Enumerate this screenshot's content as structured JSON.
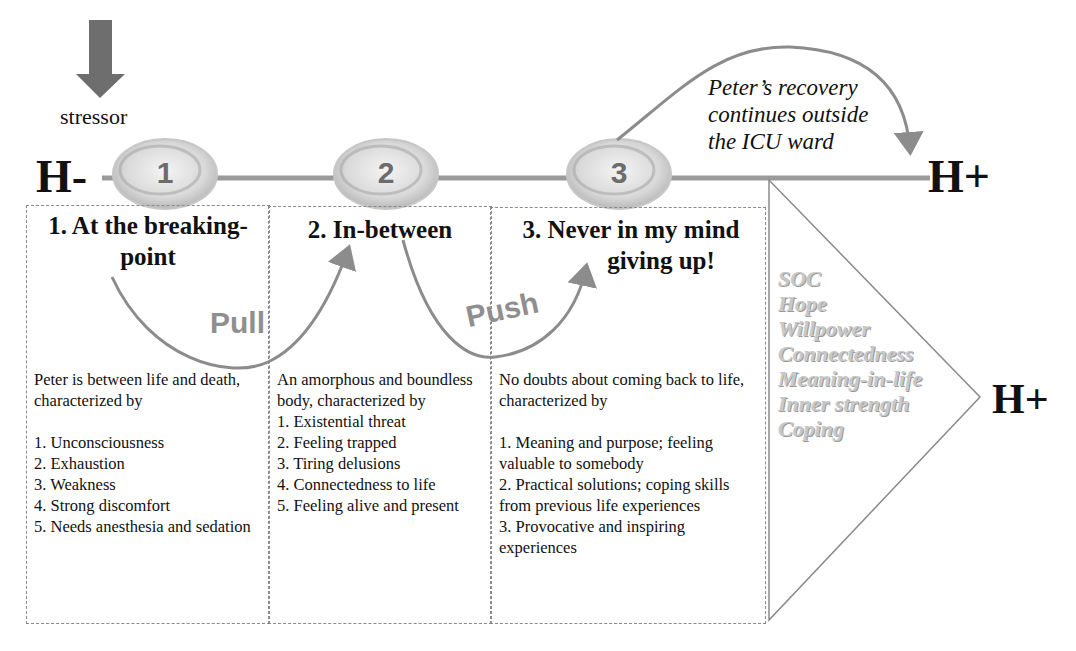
{
  "stressor": {
    "label": "stressor",
    "icon": "down-arrow-icon",
    "color": "#6e6e6e"
  },
  "timeline": {
    "start_label": "H-",
    "end_label": "H+",
    "line_color": "#9a9a9a",
    "nodes": [
      {
        "number": "1"
      },
      {
        "number": "2"
      },
      {
        "number": "3"
      }
    ]
  },
  "recovery_note": {
    "lines": [
      "Peter’s recovery",
      "continues outside",
      "the ICU ward"
    ]
  },
  "transitions": [
    {
      "label": "Pull",
      "from": "1",
      "to": "2"
    },
    {
      "label": "Push",
      "from": "2",
      "to": "3"
    }
  ],
  "stages": [
    {
      "title_lines": [
        "1. At the breaking-",
        "point"
      ],
      "intro": "Peter is between life and death, characterized by",
      "items": [
        "1. Unconsciousness",
        "2. Exhaustion",
        "3. Weakness",
        "4. Strong discomfort",
        "5. Needs anesthesia and sedation"
      ]
    },
    {
      "title_lines": [
        "2. In-between"
      ],
      "intro": "An amorphous and boundless body, characterized by",
      "items": [
        "1. Existential threat",
        "2. Feeling trapped",
        "3. Tiring delusions",
        "4. Connectedness to life",
        "5. Feeling alive and present"
      ]
    },
    {
      "title_lines": [
        "3. Never in my mind",
        "giving up!"
      ],
      "intro": "No doubts about coming back to life, characterized by",
      "items": [
        "1. Meaning and purpose; feeling valuable to somebody",
        "2. Practical solutions; coping skills from previous life experiences",
        "3. Provocative and inspiring experiences"
      ]
    }
  ],
  "resources": {
    "items": [
      "SOC",
      "Hope",
      "Willpower",
      "Connectedness",
      "Meaning-in-life",
      "Inner strength",
      "Coping"
    ],
    "target_label": "H+"
  }
}
